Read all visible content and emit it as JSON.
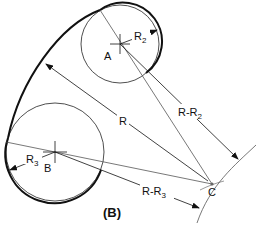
{
  "diagram": {
    "caption": "(B)",
    "points": {
      "A": {
        "label": "A",
        "x": 120,
        "y": 44
      },
      "B": {
        "label": "B",
        "x": 55,
        "y": 152
      },
      "C": {
        "label": "C",
        "x": 212,
        "y": 184
      }
    },
    "circles": {
      "A": {
        "radius_label_main": "R",
        "radius_label_sub": "2",
        "r": 39
      },
      "B": {
        "radius_label_main": "R",
        "radius_label_sub": "3",
        "r": 49
      }
    },
    "dimensions": {
      "R": "R",
      "R_minus_R2_main": "R-R",
      "R_minus_R2_sub": "2",
      "R_minus_R3_main": "R-R",
      "R_minus_R3_sub": "3"
    },
    "colors": {
      "stroke": "#111111",
      "construction": "#555555",
      "background": "#ffffff"
    }
  }
}
